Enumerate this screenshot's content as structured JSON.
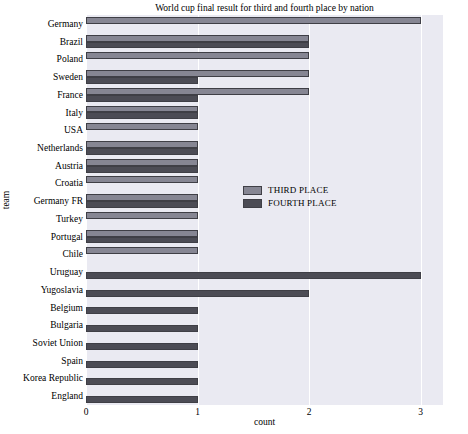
{
  "chart_data": {
    "type": "bar",
    "orientation": "horizontal",
    "title": "World cup final result for third and fourth place by nation",
    "xlabel": "count",
    "ylabel": "team",
    "xlim": [
      0,
      3.2
    ],
    "xticks": [
      0,
      1,
      2,
      3
    ],
    "xtick_labels": [
      "0",
      "1",
      "2",
      "3"
    ],
    "grid": "vertical",
    "legend_position": "center-right",
    "categories": [
      "Germany",
      "Brazil",
      "Poland",
      "Sweden",
      "France",
      "Italy",
      "USA",
      "Netherlands",
      "Austria",
      "Croatia",
      "Germany FR",
      "Turkey",
      "Portugal",
      "Chile",
      "Uruguay",
      "Yugoslavia",
      "Belgium",
      "Bulgaria",
      "Soviet Union",
      "Spain",
      "Korea Republic",
      "England"
    ],
    "series": [
      {
        "name": "THIRD PLACE",
        "color": "#868693",
        "values": [
          3,
          2,
          2,
          2,
          2,
          1,
          1,
          1,
          1,
          1,
          1,
          1,
          1,
          1,
          0,
          0,
          0,
          0,
          0,
          0,
          0,
          0
        ]
      },
      {
        "name": "FOURTH PLACE",
        "color": "#4c4c55",
        "values": [
          0,
          2,
          0,
          1,
          1,
          1,
          0,
          1,
          1,
          0,
          1,
          0,
          1,
          0,
          3,
          2,
          1,
          1,
          1,
          1,
          1,
          1
        ]
      }
    ]
  },
  "legend": {
    "entries": [
      {
        "label": "THIRD PLACE"
      },
      {
        "label": "FOURTH PLACE"
      }
    ]
  }
}
